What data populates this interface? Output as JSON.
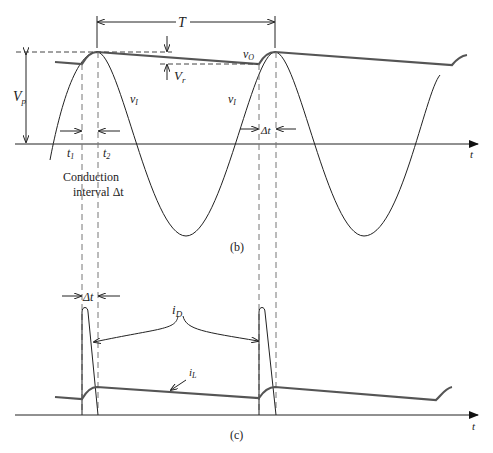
{
  "figure": {
    "panel_b": {
      "caption": "(b)",
      "period_label": "T",
      "peak_label": "V",
      "peak_sub": "p",
      "ripple_label": "V",
      "ripple_sub": "r",
      "output_label": "v",
      "output_sub": "O",
      "input_label_1": "v",
      "input_sub_1": "I",
      "input_label_2": "v",
      "input_sub_2": "I",
      "t1_label": "t",
      "t1_sub": "1",
      "t2_label": "t",
      "t2_sub": "2",
      "delta_t_label": "Δt",
      "conduction_line1": "Conduction",
      "conduction_line2": "interval Δt",
      "axis_label": "t"
    },
    "panel_c": {
      "caption": "(c)",
      "delta_t_label": "Δt",
      "diode_current_label": "i",
      "diode_current_sub": "D",
      "load_current_label": "i",
      "load_current_sub": "L",
      "axis_label": "t"
    },
    "colors": {
      "line": "#222222",
      "output_line": "#555555",
      "dashed": "#777777"
    }
  }
}
